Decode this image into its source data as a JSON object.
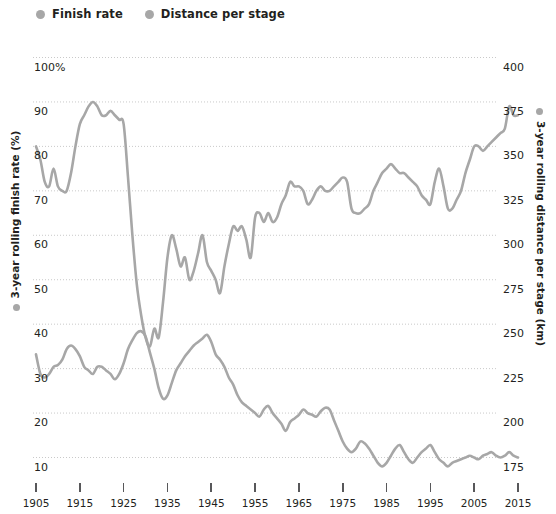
{
  "legend": {
    "items": [
      {
        "label": "Finish rate",
        "color": "#a7a7a7",
        "icon": "legend-dot-icon"
      },
      {
        "label": "Distance per stage",
        "color": "#a7a7a7",
        "icon": "legend-dot-icon"
      }
    ]
  },
  "axes": {
    "left_title": "3-year rolling finish rate (%)",
    "right_title": "3-year rolling distance per stage (km)",
    "left_ticks": [
      "100%",
      "90",
      "80",
      "70",
      "60",
      "50",
      "40",
      "30",
      "20",
      "10"
    ],
    "right_ticks": [
      "400",
      "375",
      "350",
      "325",
      "300",
      "275",
      "250",
      "225",
      "200",
      "175"
    ],
    "x_ticks": [
      "1905",
      "1915",
      "1925",
      "1935",
      "1945",
      "1955",
      "1965",
      "1975",
      "1985",
      "1995",
      "2005",
      "2015"
    ]
  },
  "chart_data": {
    "type": "line",
    "title": "",
    "subtitle": "",
    "xlabel": "",
    "ylabel": "3-year rolling finish rate (%)",
    "ylabel_right": "3-year rolling distance per stage (km)",
    "grid": true,
    "legend_position": "top-left",
    "xlim": [
      1905,
      2015
    ],
    "ylim": [
      10,
      100
    ],
    "ylim_right": [
      175,
      400
    ],
    "x": [
      1905,
      1906,
      1907,
      1908,
      1909,
      1910,
      1911,
      1912,
      1913,
      1914,
      1915,
      1916,
      1917,
      1918,
      1919,
      1920,
      1921,
      1922,
      1923,
      1924,
      1925,
      1926,
      1927,
      1928,
      1929,
      1930,
      1931,
      1932,
      1933,
      1934,
      1935,
      1936,
      1937,
      1938,
      1939,
      1940,
      1941,
      1942,
      1943,
      1944,
      1945,
      1946,
      1947,
      1948,
      1949,
      1950,
      1951,
      1952,
      1953,
      1954,
      1955,
      1956,
      1957,
      1958,
      1959,
      1960,
      1961,
      1962,
      1963,
      1964,
      1965,
      1966,
      1967,
      1968,
      1969,
      1970,
      1971,
      1972,
      1973,
      1974,
      1975,
      1976,
      1977,
      1978,
      1979,
      1980,
      1981,
      1982,
      1983,
      1984,
      1985,
      1986,
      1987,
      1988,
      1989,
      1990,
      1991,
      1992,
      1993,
      1994,
      1995,
      1996,
      1997,
      1998,
      1999,
      2000,
      2001,
      2002,
      2003,
      2004,
      2005,
      2006,
      2007,
      2008,
      2009,
      2010,
      2011,
      2012,
      2013,
      2014,
      2015
    ],
    "series": [
      {
        "name": "Finish rate",
        "axis": "left",
        "unit": "%",
        "color": "#a7a7a7",
        "values": [
          80,
          77,
          72,
          71,
          75,
          71,
          70,
          70,
          74,
          80,
          85,
          87,
          89,
          90,
          89,
          87,
          87,
          88,
          87,
          86,
          85,
          73,
          60,
          49,
          42,
          37,
          35,
          39,
          37,
          45,
          55,
          60,
          57,
          53,
          55,
          50,
          52,
          56,
          60,
          54,
          52,
          50,
          47,
          53,
          58,
          62,
          61,
          62,
          59,
          55,
          64,
          65,
          63,
          65,
          63,
          64,
          67,
          69,
          72,
          71,
          71,
          70,
          67,
          68,
          70,
          71,
          70,
          70,
          71,
          72,
          73,
          72,
          66,
          65,
          65,
          66,
          67,
          70,
          72,
          74,
          75,
          76,
          75,
          74,
          74,
          73,
          72,
          71,
          69,
          68,
          67,
          72,
          75,
          71,
          66,
          66,
          68,
          70,
          74,
          77,
          80,
          80,
          79,
          80,
          81,
          82,
          83,
          84,
          89,
          87,
          87
        ]
      },
      {
        "name": "Distance per stage",
        "axis": "right",
        "unit": "km",
        "color": "#a7a7a7",
        "values": [
          233,
          222,
          220,
          222,
          226,
          227,
          230,
          236,
          238,
          236,
          232,
          226,
          224,
          222,
          226,
          226,
          224,
          222,
          219,
          222,
          228,
          236,
          241,
          245,
          246,
          243,
          234,
          225,
          214,
          208,
          210,
          217,
          224,
          228,
          232,
          235,
          238,
          240,
          242,
          244,
          240,
          233,
          230,
          226,
          220,
          216,
          210,
          206,
          204,
          202,
          200,
          198,
          202,
          204,
          200,
          197,
          194,
          190,
          195,
          197,
          199,
          202,
          200,
          199,
          198,
          201,
          203,
          202,
          196,
          190,
          184,
          180,
          178,
          180,
          184,
          183,
          180,
          176,
          172,
          170,
          172,
          176,
          180,
          182,
          178,
          174,
          172,
          175,
          178,
          180,
          182,
          178,
          174,
          172,
          170,
          172,
          173,
          174,
          175,
          176,
          175,
          174,
          176,
          177,
          178,
          176,
          175,
          176,
          178,
          176,
          175
        ]
      }
    ]
  }
}
